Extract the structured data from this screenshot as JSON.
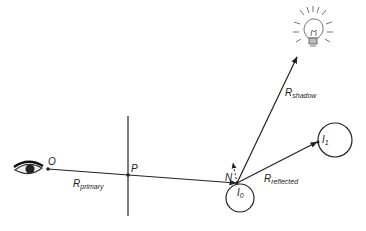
{
  "diagram": {
    "type": "ray-tracing",
    "colors": {
      "stroke": "#222222",
      "background": "#ffffff",
      "bulb": "#555555"
    },
    "labels": {
      "origin": "O",
      "pixel": "P",
      "normal": "N",
      "i0": "I",
      "i0_sub": "0",
      "i1": "I",
      "i1_sub": "1",
      "primary": "R",
      "primary_sub": "primary",
      "shadow": "R",
      "shadow_sub": "shadow",
      "reflected": "R",
      "reflected_sub": "reflected"
    },
    "icons": [
      "eye-icon",
      "light-bulb-icon"
    ]
  }
}
